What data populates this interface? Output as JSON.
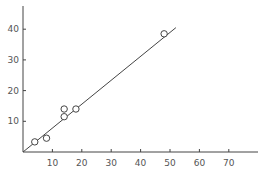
{
  "chart_data": {
    "type": "scatter",
    "title": "",
    "xlabel": "",
    "ylabel": "",
    "xlim": [
      0,
      80
    ],
    "ylim": [
      0,
      45
    ],
    "grid": false,
    "legend": null,
    "x_ticks": [
      10,
      20,
      30,
      40,
      50,
      60,
      70
    ],
    "y_ticks": [
      10,
      20,
      30,
      40
    ],
    "x_tick_labels": [
      "10",
      "20",
      "30",
      "40",
      "50",
      "60",
      "70"
    ],
    "y_tick_labels": [
      "10",
      "20",
      "30",
      "40"
    ],
    "series": [
      {
        "name": "observations",
        "marker": "open-circle",
        "points": [
          {
            "x": 4,
            "y": 3.3
          },
          {
            "x": 8,
            "y": 4.5
          },
          {
            "x": 14,
            "y": 11.5
          },
          {
            "x": 14,
            "y": 14
          },
          {
            "x": 18,
            "y": 14
          },
          {
            "x": 48,
            "y": 38.5
          }
        ]
      },
      {
        "name": "fit-line",
        "type": "line",
        "points": [
          {
            "x": 0,
            "y": 0
          },
          {
            "x": 52,
            "y": 40.5
          }
        ]
      }
    ]
  },
  "style": {
    "axis_color": "#444444",
    "line_color": "#444444",
    "marker_color": "#444444",
    "label_color": "#555555"
  }
}
